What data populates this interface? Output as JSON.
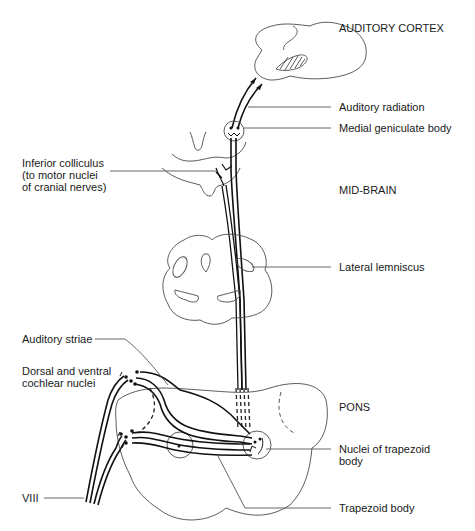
{
  "diagram": {
    "regions": {
      "cortex": "AUDITORY CORTEX",
      "midbrain": "MID-BRAIN",
      "pons": "PONS"
    },
    "labels": {
      "auditory_radiation": "Auditory radiation",
      "medial_geniculate": "Medial geniculate body",
      "inferior_colliculus": "Inferior colliculus\n(to motor nuclei\nof cranial nerves)",
      "lateral_lemniscus": "Lateral lemniscus",
      "auditory_striae": "Auditory striae",
      "cochlear_nuclei": "Dorsal and ventral\ncochlear nuclei",
      "nuclei_trapezoid": "Nuclei of trapezoid\nbody",
      "trapezoid_body": "Trapezoid body",
      "nerve_viii": "VIII"
    },
    "colors": {
      "background": "#ffffff",
      "line": "#111111",
      "outline": "#4a4a4a",
      "text": "#1a1a1a"
    }
  }
}
